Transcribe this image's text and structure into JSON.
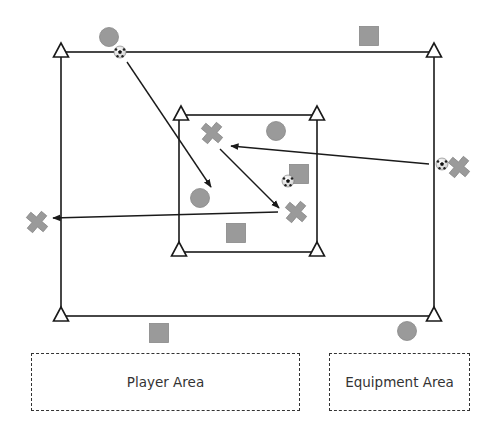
{
  "diagram": {
    "colors": {
      "line": "#1a1a1a",
      "marker_fill": "#9a9a9a",
      "marker_stroke": "#888888",
      "zone_border": "#333333"
    },
    "outer_field": {
      "x1": 61,
      "y1": 52,
      "x2": 434,
      "y2": 316
    },
    "inner_field": {
      "x1": 179,
      "y1": 115,
      "x2": 317,
      "y2": 252
    },
    "cones": [
      {
        "x": 61,
        "y": 52
      },
      {
        "x": 434,
        "y": 52
      },
      {
        "x": 61,
        "y": 316
      },
      {
        "x": 434,
        "y": 316
      },
      {
        "x": 181,
        "y": 115
      },
      {
        "x": 317,
        "y": 115
      },
      {
        "x": 179,
        "y": 251
      },
      {
        "x": 317,
        "y": 251
      }
    ],
    "circles": [
      {
        "x": 109,
        "y": 37
      },
      {
        "x": 276,
        "y": 131
      },
      {
        "x": 200,
        "y": 198
      },
      {
        "x": 407,
        "y": 331
      }
    ],
    "squares": [
      {
        "x": 369,
        "y": 36
      },
      {
        "x": 299,
        "y": 174
      },
      {
        "x": 236,
        "y": 233
      },
      {
        "x": 159,
        "y": 333
      }
    ],
    "crosses": [
      {
        "x": 212,
        "y": 133
      },
      {
        "x": 296,
        "y": 212
      },
      {
        "x": 459,
        "y": 167
      },
      {
        "x": 37,
        "y": 222
      }
    ],
    "balls": [
      {
        "x": 120,
        "y": 52
      },
      {
        "x": 288,
        "y": 181
      },
      {
        "x": 442,
        "y": 164
      }
    ],
    "arrows": [
      {
        "x1": 127,
        "y1": 62,
        "x2": 211,
        "y2": 187
      },
      {
        "x1": 220,
        "y1": 149,
        "x2": 279,
        "y2": 208
      },
      {
        "x1": 429,
        "y1": 164,
        "x2": 231,
        "y2": 146
      },
      {
        "x1": 278,
        "y1": 212,
        "x2": 53,
        "y2": 218
      }
    ],
    "zones": {
      "player_area": "Player Area",
      "equipment_area": "Equipment Area"
    }
  }
}
